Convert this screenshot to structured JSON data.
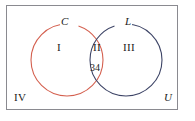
{
  "figure": {
    "type": "venn-diagram",
    "sets": 2,
    "universe_label": "U",
    "colors": {
      "set_c_stroke": "#d4604f",
      "set_l_stroke": "#3d4466",
      "frame_stroke": "#8a8a90",
      "text": "#1b1b22",
      "background": "#ffffff"
    }
  },
  "sets": [
    {
      "id": "C",
      "label": "C",
      "color": "#d4604f",
      "cx": 67,
      "cy": 60,
      "r": 36
    },
    {
      "id": "L",
      "label": "L",
      "color": "#3d4466",
      "cx": 126,
      "cy": 60,
      "r": 36
    }
  ],
  "regions": [
    {
      "id": "I",
      "label": "I",
      "description": "C only"
    },
    {
      "id": "II",
      "label": "II",
      "description": "C and L intersection",
      "value": "34"
    },
    {
      "id": "III",
      "label": "III",
      "description": "L only"
    },
    {
      "id": "IV",
      "label": "IV",
      "description": "outside both sets"
    }
  ],
  "labels": {
    "set_c": "C",
    "set_l": "L",
    "region_i": "I",
    "region_ii": "II",
    "region_iii": "III",
    "region_iv": "IV",
    "intersection_count": "34",
    "universe": "U"
  }
}
